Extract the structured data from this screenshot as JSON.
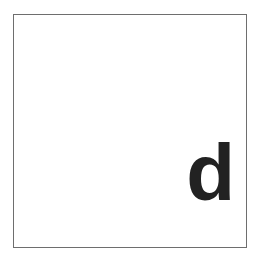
{
  "panel": {
    "label": "d",
    "border_color": "#6e6e6e",
    "label_color": "#222222",
    "background": "#ffffff"
  }
}
